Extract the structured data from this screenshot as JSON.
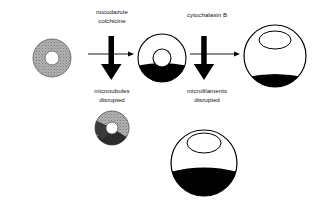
{
  "figure": {
    "background_color": "#ffffff",
    "ink_color": "#000000",
    "cytoplasm_gray": "#a8a8a8",
    "nucleus_color": "#ffffff"
  },
  "treatments": {
    "first": {
      "line1": "nocodazole",
      "line2": "colchicine",
      "result_line1": "microtubules",
      "result_line2": "disrupted"
    },
    "second": {
      "line1": "cytochalasin B",
      "line2": "",
      "result_line1": "microfilaments",
      "result_line2": "disrupted"
    }
  },
  "cells": [
    {
      "id": "untreated-cell",
      "name": "untreated-cell",
      "fill_style": "stippled-gray",
      "shape": "circle",
      "cx": 52,
      "cy": 58,
      "r": 19,
      "nucleus_rx": 7,
      "nucleus_ry": 7,
      "nucleus_cx": 52,
      "nucleus_cy": 58,
      "black_fraction": 0
    },
    {
      "id": "microtubule-disrupted-cell",
      "name": "microtubule-disrupted-cell",
      "fill_style": "white-black-bottom",
      "shape": "circle",
      "cx": 162,
      "cy": 58,
      "r": 24,
      "nucleus_rx": 9,
      "nucleus_ry": 9,
      "nucleus_cx": 162,
      "nucleus_cy": 58,
      "black_fraction": 0.38
    },
    {
      "id": "microfilament-disrupted-cell",
      "name": "microfilament-disrupted-cell",
      "fill_style": "white-black-crescent",
      "shape": "circle",
      "cx": 275,
      "cy": 56,
      "r": 31,
      "nucleus_rx": 16,
      "nucleus_ry": 9,
      "nucleus_cx": 275,
      "nucleus_cy": 40,
      "black_fraction": 0.12
    },
    {
      "id": "microtubule-disrupted-cell-lower",
      "name": "microtubule-disrupted-cell-lower",
      "fill_style": "stippled-gray-wedge",
      "shape": "circle",
      "cx": 112,
      "cy": 128,
      "r": 17,
      "nucleus_rx": 6,
      "nucleus_ry": 6,
      "nucleus_cx": 112,
      "nucleus_cy": 128,
      "black_fraction": 0.25
    },
    {
      "id": "microfilament-disrupted-cell-lower",
      "name": "microfilament-disrupted-cell-lower",
      "fill_style": "white-black-bottom",
      "shape": "circle",
      "cx": 204,
      "cy": 163,
      "r": 33,
      "nucleus_rx": 17,
      "nucleus_ry": 10,
      "nucleus_cx": 204,
      "nucleus_cy": 143,
      "black_fraction": 0.4
    }
  ],
  "arrows": [
    {
      "id": "arrow-down-first",
      "name": "arrow-down-treatment-one",
      "direction": "down",
      "x": 112,
      "y_start": 36,
      "y_end": 80
    },
    {
      "id": "arrow-right-first",
      "name": "arrow-right-treatment-one",
      "direction": "right",
      "y": 54,
      "x_start": 88,
      "x_end": 134
    },
    {
      "id": "arrow-down-second",
      "name": "arrow-down-treatment-two",
      "direction": "down",
      "x": 204,
      "y_start": 36,
      "y_end": 80
    },
    {
      "id": "arrow-right-second",
      "name": "arrow-right-treatment-two",
      "direction": "right",
      "y": 54,
      "x_start": 190,
      "x_end": 240
    }
  ]
}
